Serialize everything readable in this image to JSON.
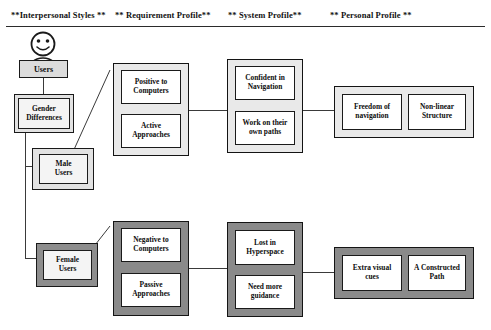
{
  "headers": [
    {
      "label": "**Interpersonal Styles **"
    },
    {
      "label": "** Requirement Profile**"
    },
    {
      "label": "** System Profile**"
    },
    {
      "label": "** Personal Profile **"
    }
  ],
  "icons": {
    "person": "user-smiley-icon"
  },
  "nodes": {
    "users": "Users",
    "gender_differences_line1": "Gender",
    "gender_differences_line2": "Differences",
    "male_users_line1": "Male",
    "male_users_line2": "Users",
    "female_users_line1": "Female",
    "female_users_line2": "Users",
    "positive_to_computers_line1": "Positive to",
    "positive_to_computers_line2": "Computers",
    "active_approaches_line1": "Active",
    "active_approaches_line2": "Approaches",
    "negative_to_computers_line1": "Negative to",
    "negative_to_computers_line2": "Computers",
    "passive_approaches_line1": "Passive",
    "passive_approaches_line2": "Approaches",
    "confident_in_navigation_line1": "Confident in",
    "confident_in_navigation_line2": "Navigation",
    "work_own_paths_line1": "Work on their",
    "work_own_paths_line2": "own paths",
    "lost_in_hyperspace_line1": "Lost in",
    "lost_in_hyperspace_line2": "Hyperspace",
    "need_more_guidance_line1": "Need more",
    "need_more_guidance_line2": "guidance",
    "freedom_of_navigation_line1": "Freedom of",
    "freedom_of_navigation_line2": "navigation",
    "non_linear_structure_line1": "Non-linear",
    "non_linear_structure_line2": "Structure",
    "extra_visual_cues_line1": "Extra visual",
    "extra_visual_cues_line2": "cues",
    "a_constructed_path_line1": "A Constructed",
    "a_constructed_path_line2": "Path"
  },
  "colors": {
    "background": "#ffffff",
    "line": "#3a3a3a",
    "border": "#141414",
    "group_light_fill": "#e9e9e9",
    "group_dark_fill": "#8a8a8a",
    "leaf_fill": "#ffffff",
    "text": "#0d0d0d"
  }
}
